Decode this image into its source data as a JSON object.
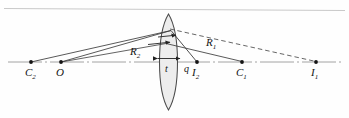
{
  "figure": {
    "type": "optics-ray-diagram",
    "background_color": "#fefefe",
    "axis_color": "#8a8a8a",
    "ray_color": "#3b3b3b",
    "dashed_color": "#555555",
    "lens_fill": "#ececec",
    "lens_stroke": "#4a4a4a",
    "top_rule_color": "#c8c8c8",
    "point_color": "#1a1a1a"
  },
  "labels": {
    "c2": {
      "text": "C",
      "sub": "2"
    },
    "o": {
      "text": "O",
      "sub": ""
    },
    "r2": {
      "text": "R",
      "sub": "2"
    },
    "t": {
      "text": "t",
      "sub": ""
    },
    "q": {
      "text": "q",
      "sub": ""
    },
    "i2": {
      "text": "I",
      "sub": "2"
    },
    "c1": {
      "text": "C",
      "sub": "1"
    },
    "r1": {
      "text": "R",
      "sub": "1"
    },
    "i1": {
      "text": "I",
      "sub": "1"
    }
  },
  "geometry": {
    "axis_y": 62,
    "axis_x_start": 8,
    "axis_x_end": 343,
    "lens": {
      "center_x": 168.5,
      "top_y": 14,
      "bottom_y": 110,
      "left_vertex_x": 157.5,
      "right_vertex_x": 180.0
    },
    "points": [
      {
        "name": "C2",
        "x": 31,
        "y": 62
      },
      {
        "name": "O",
        "x": 61,
        "y": 62
      },
      {
        "name": "I2",
        "x": 197,
        "y": 62
      },
      {
        "name": "C1",
        "x": 242,
        "y": 62
      },
      {
        "name": "I1",
        "x": 316,
        "y": 62
      }
    ],
    "measures": {
      "t_left_x": 157.5,
      "t_right_x": 180.0,
      "t_y": 62,
      "R2_arrow_y": 50,
      "R1_label_x": 214,
      "R1_label_y": 44,
      "R2_label_x": 136,
      "R2_label_y": 51,
      "q_label_x": 186,
      "q_label_y": 70
    }
  }
}
